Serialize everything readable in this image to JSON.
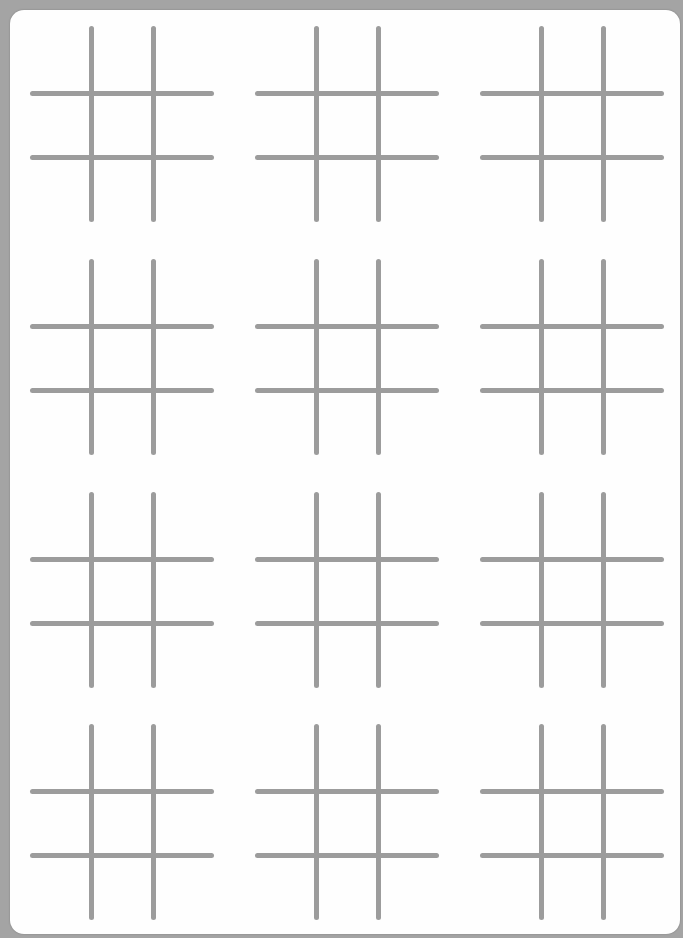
{
  "title": "Tic-Tac-Toe Boards",
  "colors": {
    "background": "#a4a4a4",
    "sheet": "#fefefe",
    "line": "#9c9c9c"
  },
  "grid": {
    "rows": 4,
    "cols": 3
  },
  "boards": [
    {
      "id": 1,
      "row": 1,
      "col": 1,
      "cells": [
        "",
        "",
        "",
        "",
        "",
        "",
        "",
        "",
        ""
      ]
    },
    {
      "id": 2,
      "row": 1,
      "col": 2,
      "cells": [
        "",
        "",
        "",
        "",
        "",
        "",
        "",
        "",
        ""
      ]
    },
    {
      "id": 3,
      "row": 1,
      "col": 3,
      "cells": [
        "",
        "",
        "",
        "",
        "",
        "",
        "",
        "",
        ""
      ]
    },
    {
      "id": 4,
      "row": 2,
      "col": 1,
      "cells": [
        "",
        "",
        "",
        "",
        "",
        "",
        "",
        "",
        ""
      ]
    },
    {
      "id": 5,
      "row": 2,
      "col": 2,
      "cells": [
        "",
        "",
        "",
        "",
        "",
        "",
        "",
        "",
        ""
      ]
    },
    {
      "id": 6,
      "row": 2,
      "col": 3,
      "cells": [
        "",
        "",
        "",
        "",
        "",
        "",
        "",
        "",
        ""
      ]
    },
    {
      "id": 7,
      "row": 3,
      "col": 1,
      "cells": [
        "",
        "",
        "",
        "",
        "",
        "",
        "",
        "",
        ""
      ]
    },
    {
      "id": 8,
      "row": 3,
      "col": 2,
      "cells": [
        "",
        "",
        "",
        "",
        "",
        "",
        "",
        "",
        ""
      ]
    },
    {
      "id": 9,
      "row": 3,
      "col": 3,
      "cells": [
        "",
        "",
        "",
        "",
        "",
        "",
        "",
        "",
        ""
      ]
    },
    {
      "id": 10,
      "row": 4,
      "col": 1,
      "cells": [
        "",
        "",
        "",
        "",
        "",
        "",
        "",
        "",
        ""
      ]
    },
    {
      "id": 11,
      "row": 4,
      "col": 2,
      "cells": [
        "",
        "",
        "",
        "",
        "",
        "",
        "",
        "",
        ""
      ]
    },
    {
      "id": 12,
      "row": 4,
      "col": 3,
      "cells": [
        "",
        "",
        "",
        "",
        "",
        "",
        "",
        "",
        ""
      ]
    }
  ]
}
